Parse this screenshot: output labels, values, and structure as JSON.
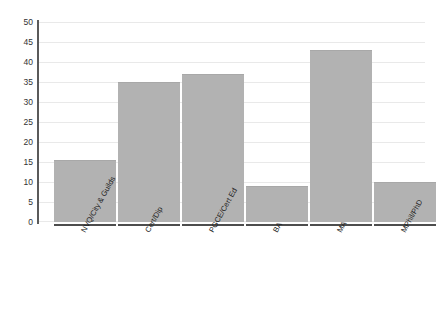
{
  "chart_data": {
    "type": "bar",
    "title": "",
    "subtitle": "",
    "xlabel": "",
    "ylabel": "",
    "categories": [
      "NVQ/City & Guilds",
      "Cert/Dip",
      "PGCE/Cert Ed",
      "BA",
      "MA",
      "MPhil/PhD"
    ],
    "values": [
      15.5,
      35,
      37,
      9,
      43,
      10
    ],
    "ylim": [
      0,
      50
    ],
    "yticks": [
      0,
      5,
      10,
      15,
      20,
      25,
      30,
      35,
      40,
      45,
      50
    ],
    "ytick_labels": [
      "0",
      "5",
      "10",
      "15",
      "20",
      "25",
      "30",
      "35",
      "40",
      "45",
      "50"
    ],
    "grid": true,
    "grid_axis": "y",
    "legend": false,
    "legend_position": "none",
    "bar_color": "#b2b2b2",
    "grid_color": "#e9e9e9",
    "axis_color": "#5a5a5a",
    "background_color": "#ffffff",
    "tick_label_rotation": -61
  }
}
